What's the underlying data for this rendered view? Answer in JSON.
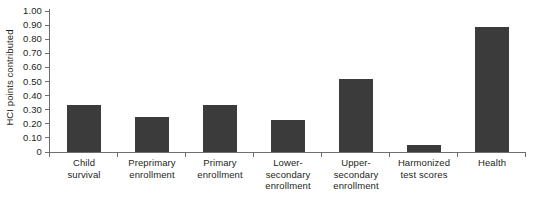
{
  "chart_data": {
    "type": "bar",
    "title": "",
    "xlabel": "",
    "ylabel": "HCI points contributed",
    "categories": [
      "Child survival",
      "Preprimary enrollment",
      "Primary enrollment",
      "Lower-secondary enrollment",
      "Primary enrollment",
      "Harmonized test scores",
      "Health"
    ],
    "category_lines": [
      [
        "Child",
        "survival"
      ],
      [
        "Preprimary",
        "enrollment"
      ],
      [
        "Primary",
        "enrollment"
      ],
      [
        "Lower-",
        "secondary",
        "enrollment"
      ],
      [
        "Upper-",
        "secondary",
        "enrollment"
      ],
      [
        "Harmonized",
        "test scores"
      ],
      [
        "Health"
      ]
    ],
    "values": [
      0.33,
      0.25,
      0.33,
      0.23,
      0.52,
      0.05,
      0.89
    ],
    "ylim": [
      0,
      1.0
    ],
    "ytick_step": 0.1,
    "ytick_labels": [
      "1.00",
      "0.90",
      "0.80",
      "0.70",
      "0.60",
      "0.50",
      "0.40",
      "0.30",
      "0.20",
      "0.10",
      "0"
    ],
    "ytick_values": [
      1.0,
      0.9,
      0.8,
      0.7,
      0.6,
      0.5,
      0.4,
      0.3,
      0.2,
      0.1,
      0
    ],
    "grid": false,
    "legend": null,
    "bar_color": "#3b3b3b",
    "axis_color": "#6d6e71",
    "text_color": "#231f20",
    "background": "#ffffff"
  }
}
